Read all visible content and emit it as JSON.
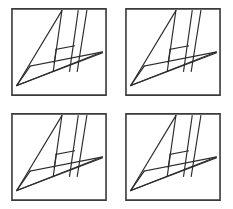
{
  "image": {
    "title": "Four identical abstract line-figure panels",
    "width": 233,
    "height": 209,
    "background_color": "#ffffff",
    "line_color": "#2b2b2b",
    "frame_color": "#3a3a3a",
    "panel_count": 4,
    "layout": "2x2 grid"
  },
  "panels": [
    {
      "id": "panel-top-left",
      "label": "Top left panel",
      "x": 11,
      "y": 8,
      "width": 96,
      "height": 88
    },
    {
      "id": "panel-top-right",
      "label": "Top right panel",
      "x": 125,
      "y": 8,
      "width": 96,
      "height": 88
    },
    {
      "id": "panel-bottom-left",
      "label": "Bottom left panel",
      "x": 11,
      "y": 113,
      "width": 96,
      "height": 88
    },
    {
      "id": "panel-bottom-right",
      "label": "Bottom right panel",
      "x": 125,
      "y": 113,
      "width": 96,
      "height": 88
    }
  ],
  "figure": {
    "viewbox": "0 0 100 100",
    "frame": {
      "x": 1,
      "y": 1,
      "width": 98,
      "height": 98
    },
    "segments": [
      {
        "name": "spike-left-edge",
        "x1": 53,
        "y1": 3,
        "x2": 6,
        "y2": 88
      },
      {
        "name": "spike-right-edge",
        "x1": 53,
        "y1": 3,
        "x2": 44,
        "y2": 72
      },
      {
        "name": "bar-right-outer",
        "x1": 79,
        "y1": 3,
        "x2": 69,
        "y2": 72
      },
      {
        "name": "bar-right-inner",
        "x1": 70,
        "y1": 3,
        "x2": 61,
        "y2": 72
      },
      {
        "name": "crossbar-upper",
        "x1": 47,
        "y1": 47,
        "x2": 66,
        "y2": 43
      },
      {
        "name": "crossbar-left-stub",
        "x1": 47,
        "y1": 47,
        "x2": 45,
        "y2": 62
      },
      {
        "name": "diagonal-long-upper",
        "x1": 6,
        "y1": 88,
        "x2": 95,
        "y2": 50
      },
      {
        "name": "diagonal-long-lower",
        "x1": 6,
        "y1": 88,
        "x2": 95,
        "y2": 51
      },
      {
        "name": "baseline-short",
        "x1": 20,
        "y1": 66,
        "x2": 95,
        "y2": 50
      },
      {
        "name": "left-riser",
        "x1": 20,
        "y1": 66,
        "x2": 6,
        "y2": 88
      }
    ]
  }
}
